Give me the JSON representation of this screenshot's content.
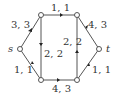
{
  "graph": {
    "type": "flow-network",
    "nodes": [
      {
        "id": "s",
        "label": "s",
        "x": 20,
        "y": 49
      },
      {
        "id": "u",
        "label": "",
        "x": 41,
        "y": 15
      },
      {
        "id": "v",
        "label": "",
        "x": 77,
        "y": 15
      },
      {
        "id": "t",
        "label": "t",
        "x": 99,
        "y": 49
      },
      {
        "id": "x",
        "label": "",
        "x": 41,
        "y": 80
      },
      {
        "id": "y",
        "label": "",
        "x": 77,
        "y": 80
      }
    ],
    "edges": [
      {
        "from": "s",
        "to": "u",
        "label": "3, 3"
      },
      {
        "from": "u",
        "to": "v",
        "label": "1, 1"
      },
      {
        "from": "u",
        "to": "x",
        "label": "2, 2"
      },
      {
        "from": "y",
        "to": "v",
        "label": "2, 2"
      },
      {
        "from": "v",
        "to": "t",
        "label": "4, 3"
      },
      {
        "from": "s",
        "to": "x",
        "label": "1, 1"
      },
      {
        "from": "x",
        "to": "y",
        "label": "4, 3"
      },
      {
        "from": "y",
        "to": "t",
        "label": "1, 1"
      }
    ]
  },
  "labels": {
    "s": "s",
    "t": "t",
    "e_su": "3, 3",
    "e_uv": "1, 1",
    "e_ux": "2, 2",
    "e_yv": "2, 2",
    "e_vt": "4, 3",
    "e_sx": "1, 1",
    "e_xy": "4, 3",
    "e_yt": "1, 1"
  }
}
